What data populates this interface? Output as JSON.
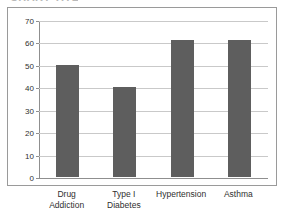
{
  "figure": {
    "clipped_title_remnant": "CHART TITLE",
    "background_color": "#ffffff",
    "frame_color": "#9a9a9a",
    "bar_color": "#5e5e5e",
    "gridline_color": "#c9c9c9",
    "axis_color": "#8f8f8f"
  },
  "chart_data": {
    "type": "bar",
    "title": "",
    "subtitle": "",
    "xlabel": "",
    "ylabel": "",
    "ylim": [
      0,
      70
    ],
    "yticks": [
      0,
      10,
      20,
      30,
      40,
      50,
      60,
      70
    ],
    "ytick_labels": [
      "0",
      "10",
      "20",
      "30",
      "40",
      "50",
      "60",
      "70"
    ],
    "grid": true,
    "legend": false,
    "legend_position": "none",
    "orientation": "vertical",
    "categories": [
      "Drug Addiction",
      "Type I Diabetes",
      "Hypertension",
      "Asthma"
    ],
    "category_label_lines": [
      [
        "Drug",
        "Addiction"
      ],
      [
        "Type I",
        "Diabetes"
      ],
      [
        "Hypertension"
      ],
      [
        "Asthma"
      ]
    ],
    "values": [
      50,
      40,
      61,
      61
    ],
    "series": [
      {
        "name": "Percent",
        "values": [
          50,
          40,
          61,
          61
        ]
      }
    ],
    "annotations": []
  }
}
